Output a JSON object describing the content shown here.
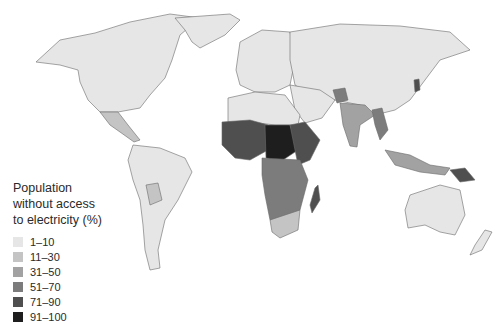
{
  "legend": {
    "title": "Population without access to electricity (%)",
    "title_lines": [
      "Population",
      "without access",
      "to electricity (%)"
    ],
    "items": [
      {
        "label": "1–10",
        "color": "#e6e6e6"
      },
      {
        "label": "11–30",
        "color": "#c4c4c4"
      },
      {
        "label": "31–50",
        "color": "#a2a2a2"
      },
      {
        "label": "51–70",
        "color": "#7c7c7c"
      },
      {
        "label": "71–90",
        "color": "#4f4f4f"
      },
      {
        "label": "91–100",
        "color": "#1e1e1e"
      }
    ]
  },
  "regions": {
    "north_america": "1–10",
    "central_america": "11–30",
    "south_america": "1–10",
    "bolivia": "11–30",
    "europe": "1–10",
    "russia": "1–10",
    "middle_east": "1–10",
    "north_africa": "1–10",
    "west_africa": "71–90",
    "central_africa": "91–100",
    "east_africa": "71–90",
    "southern_africa": "51–70",
    "south_africa": "11–30",
    "madagascar": "71–90",
    "afghanistan": "51–70",
    "india": "31–50",
    "myanmar": "51–70",
    "china": "1–10",
    "north_korea": "71–90",
    "indonesia": "31–50",
    "papua_new_guinea": "71–90",
    "australia": "1–10",
    "new_zealand": "1–10",
    "greenland": "1–10"
  }
}
